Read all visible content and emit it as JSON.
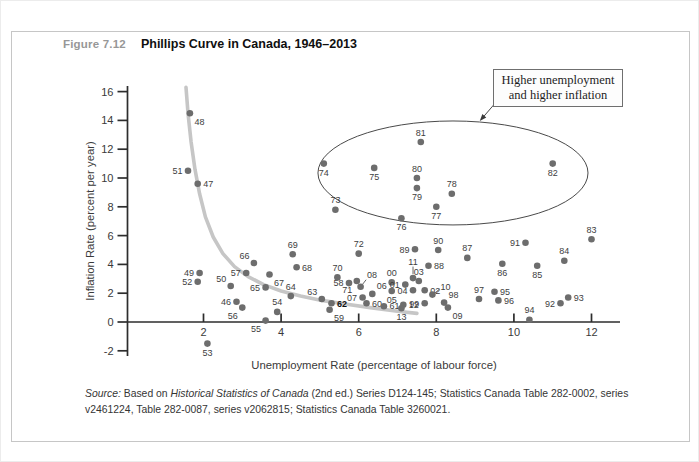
{
  "figure": {
    "label": "Figure 7.12",
    "title": "Phillips Curve in Canada, 1946–2013"
  },
  "annotation_box": {
    "line1": "Higher unemployment",
    "line2": "and higher inflation"
  },
  "source": {
    "prefix": "Source:",
    "seg1": " Based on ",
    "italic": "Historical Statistics of Canada",
    "seg2": " (2nd ed.) Series D124-145; Statistics Canada Table 282-0002, series v2461224, Table 282-0087, series v2062815; Statistics Canada Table 3260021."
  },
  "chart_data": {
    "type": "scatter",
    "title": "Phillips Curve in Canada, 1946–2013",
    "xlabel": "Unemployment Rate (percentage of labour force)",
    "ylabel": "Inflation Rate (percent per year)",
    "xlim": [
      0,
      12.8
    ],
    "ylim": [
      -3,
      16.8
    ],
    "x_ticks": [
      2,
      4,
      6,
      8,
      10,
      12
    ],
    "y_ticks": [
      -2,
      0,
      2,
      4,
      6,
      8,
      10,
      12,
      14,
      16
    ],
    "grid": false,
    "legend": "none",
    "highlight_year": "62",
    "colors": {
      "dot": "#6d6d6d",
      "curve": "#c6c6c6",
      "axis": "#2d2d2d",
      "point_label": "#3e3e3e",
      "ellipse": "#4a4a4a"
    },
    "points": [
      {
        "yr": "46",
        "u": 2.85,
        "i": 1.4,
        "pos": "w"
      },
      {
        "yr": "47",
        "u": 1.85,
        "i": 9.6,
        "pos": "e"
      },
      {
        "yr": "48",
        "u": 1.65,
        "i": 14.5,
        "pos": "se"
      },
      {
        "yr": "49",
        "u": 1.9,
        "i": 3.4,
        "pos": "w"
      },
      {
        "yr": "50",
        "u": 2.7,
        "i": 2.5,
        "pos": "nw"
      },
      {
        "yr": "51",
        "u": 1.6,
        "i": 10.5,
        "pos": "w"
      },
      {
        "yr": "52",
        "u": 1.85,
        "i": 2.8,
        "pos": "w"
      },
      {
        "yr": "53",
        "u": 2.1,
        "i": -1.5,
        "pos": "s"
      },
      {
        "yr": "54",
        "u": 3.9,
        "i": 0.7,
        "pos": "n"
      },
      {
        "yr": "55",
        "u": 3.6,
        "i": 0.1,
        "pos": "sw"
      },
      {
        "yr": "56",
        "u": 3.0,
        "i": 1.0,
        "pos": "sw"
      },
      {
        "yr": "57",
        "u": 3.1,
        "i": 3.4,
        "pos": "w"
      },
      {
        "yr": "58",
        "u": 5.75,
        "i": 2.7,
        "pos": "w"
      },
      {
        "yr": "59",
        "u": 5.25,
        "i": 0.85,
        "pos": "se"
      },
      {
        "yr": "60",
        "u": 6.2,
        "i": 1.3,
        "pos": "e"
      },
      {
        "yr": "61",
        "u": 6.65,
        "i": 1.1,
        "pos": "e"
      },
      {
        "yr": "62",
        "u": 5.3,
        "i": 1.3,
        "pos": "e",
        "bold": true
      },
      {
        "yr": "63",
        "u": 5.05,
        "i": 1.6,
        "pos": "nw"
      },
      {
        "yr": "64",
        "u": 4.25,
        "i": 1.8,
        "pos": "n"
      },
      {
        "yr": "65",
        "u": 3.6,
        "i": 2.4,
        "pos": "w"
      },
      {
        "yr": "66",
        "u": 3.3,
        "i": 4.1,
        "pos": "nw"
      },
      {
        "yr": "67",
        "u": 3.7,
        "i": 3.3,
        "pos": "se"
      },
      {
        "yr": "68",
        "u": 4.4,
        "i": 3.8,
        "pos": "e"
      },
      {
        "yr": "69",
        "u": 4.3,
        "i": 4.7,
        "pos": "n"
      },
      {
        "yr": "70",
        "u": 5.45,
        "i": 3.1,
        "pos": "n"
      },
      {
        "yr": "71",
        "u": 5.95,
        "i": 2.85,
        "pos": "sw"
      },
      {
        "yr": "72",
        "u": 6.0,
        "i": 4.75,
        "pos": "n"
      },
      {
        "yr": "73",
        "u": 5.4,
        "i": 7.8,
        "pos": "n"
      },
      {
        "yr": "74",
        "u": 5.1,
        "i": 11.0,
        "pos": "s"
      },
      {
        "yr": "75",
        "u": 6.4,
        "i": 10.7,
        "pos": "s"
      },
      {
        "yr": "76",
        "u": 7.1,
        "i": 7.2,
        "pos": "s"
      },
      {
        "yr": "77",
        "u": 8.0,
        "i": 8.0,
        "pos": "s"
      },
      {
        "yr": "78",
        "u": 8.4,
        "i": 8.9,
        "pos": "n"
      },
      {
        "yr": "79",
        "u": 7.5,
        "i": 9.3,
        "pos": "s"
      },
      {
        "yr": "80",
        "u": 7.5,
        "i": 10.0,
        "pos": "n"
      },
      {
        "yr": "81",
        "u": 7.6,
        "i": 12.5,
        "pos": "n"
      },
      {
        "yr": "82",
        "u": 11.0,
        "i": 11.0,
        "pos": "s"
      },
      {
        "yr": "83",
        "u": 12.0,
        "i": 5.75,
        "pos": "n"
      },
      {
        "yr": "84",
        "u": 11.3,
        "i": 4.25,
        "pos": "n"
      },
      {
        "yr": "85",
        "u": 10.6,
        "i": 3.9,
        "pos": "s"
      },
      {
        "yr": "86",
        "u": 9.7,
        "i": 4.05,
        "pos": "s"
      },
      {
        "yr": "87",
        "u": 8.8,
        "i": 4.45,
        "pos": "n"
      },
      {
        "yr": "88",
        "u": 7.8,
        "i": 3.9,
        "pos": "e"
      },
      {
        "yr": "89",
        "u": 7.45,
        "i": 5.05,
        "pos": "w"
      },
      {
        "yr": "90",
        "u": 8.05,
        "i": 5.0,
        "pos": "n"
      },
      {
        "yr": "91",
        "u": 10.3,
        "i": 5.5,
        "pos": "w"
      },
      {
        "yr": "92",
        "u": 11.2,
        "i": 1.3,
        "pos": "w"
      },
      {
        "yr": "93",
        "u": 11.4,
        "i": 1.7,
        "pos": "e"
      },
      {
        "yr": "94",
        "u": 10.4,
        "i": 0.15,
        "pos": "n"
      },
      {
        "yr": "95",
        "u": 9.5,
        "i": 2.1,
        "pos": "e"
      },
      {
        "yr": "96",
        "u": 9.6,
        "i": 1.5,
        "pos": "e"
      },
      {
        "yr": "97",
        "u": 9.1,
        "i": 1.6,
        "pos": "n"
      },
      {
        "yr": "98",
        "u": 8.2,
        "i": 1.35,
        "pos": "ne"
      },
      {
        "yr": "99",
        "u": 7.7,
        "i": 1.3,
        "pos": "w"
      },
      {
        "yr": "00",
        "u": 6.85,
        "i": 2.75,
        "pos": "n"
      },
      {
        "yr": "01",
        "u": 7.2,
        "i": 2.6,
        "pos": "w"
      },
      {
        "yr": "02",
        "u": 7.7,
        "i": 2.2,
        "pos": "e"
      },
      {
        "yr": "03",
        "u": 7.55,
        "i": 2.85,
        "pos": "n"
      },
      {
        "yr": "04",
        "u": 7.4,
        "i": 2.2,
        "pos": "w"
      },
      {
        "yr": "05",
        "u": 6.85,
        "i": 2.15,
        "pos": "s"
      },
      {
        "yr": "06",
        "u": 6.35,
        "i": 1.95,
        "pos": "ne"
      },
      {
        "yr": "07",
        "u": 6.1,
        "i": 1.7,
        "pos": "w"
      },
      {
        "yr": "08",
        "u": 6.05,
        "i": 2.45,
        "pos": "ne",
        "leader": "ne"
      },
      {
        "yr": "09",
        "u": 8.3,
        "i": 1.0,
        "pos": "se"
      },
      {
        "yr": "10",
        "u": 7.9,
        "i": 1.9,
        "pos": "ne",
        "leader": "ne2"
      },
      {
        "yr": "11",
        "u": 7.4,
        "i": 3.05,
        "pos": "n",
        "leader": "n"
      },
      {
        "yr": "12",
        "u": 7.15,
        "i": 1.2,
        "pos": "e"
      },
      {
        "yr": "13",
        "u": 7.1,
        "i": 0.95,
        "pos": "s"
      }
    ],
    "phillips_curve": [
      [
        1.55,
        16.3
      ],
      [
        1.6,
        14.5
      ],
      [
        1.68,
        12.5
      ],
      [
        1.78,
        10.6
      ],
      [
        1.9,
        8.9
      ],
      [
        2.05,
        7.3
      ],
      [
        2.25,
        5.9
      ],
      [
        2.5,
        4.75
      ],
      [
        2.8,
        3.85
      ],
      [
        3.15,
        3.15
      ],
      [
        3.55,
        2.6
      ],
      [
        4.0,
        2.15
      ],
      [
        4.5,
        1.8
      ],
      [
        5.05,
        1.5
      ],
      [
        5.65,
        1.25
      ],
      [
        6.3,
        1.0
      ],
      [
        7.0,
        0.75
      ],
      [
        7.5,
        0.6
      ]
    ],
    "ellipse": {
      "cx": 8.43,
      "cy": 10.35,
      "rx": 3.48,
      "ry": 3.61
    },
    "arrow": {
      "x1": 9.55,
      "y1": 15.3,
      "x2": 9.12,
      "y2": 13.95
    }
  }
}
